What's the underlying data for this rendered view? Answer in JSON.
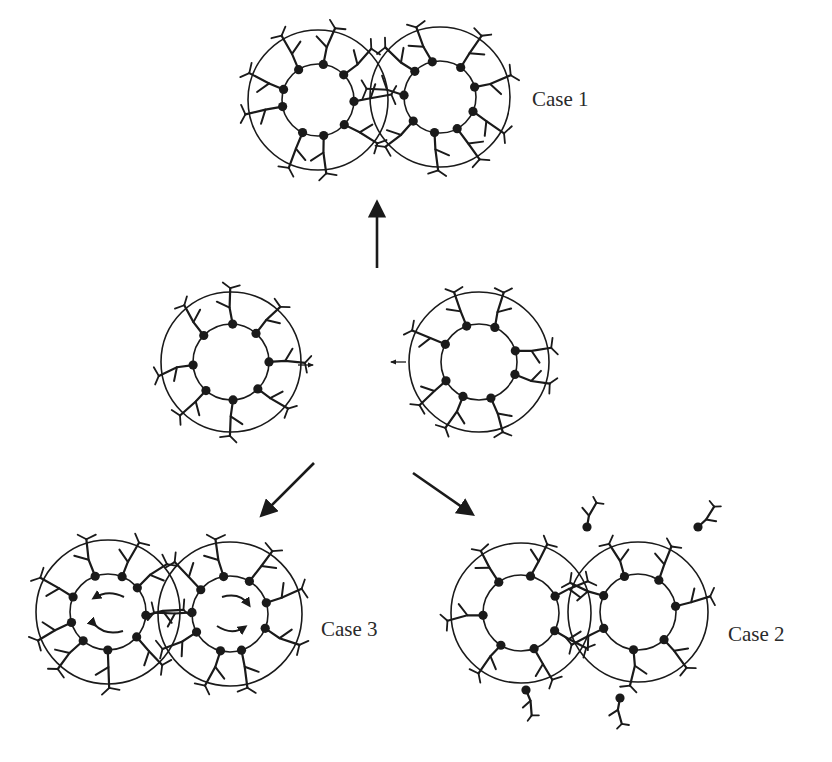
{
  "diagram": {
    "type": "schematic",
    "ink_color": "#1a1a1a",
    "background": "#ffffff",
    "labels": {
      "case1": "Case 1",
      "case2": "Case 2",
      "case3": "Case 3"
    },
    "nodes": [
      {
        "id": "initial-left",
        "cx": 231,
        "cy": 362,
        "r_outer": 70,
        "r_inner": 38,
        "ligands": 8
      },
      {
        "id": "initial-right",
        "cx": 479,
        "cy": 362,
        "r_outer": 70,
        "r_inner": 38,
        "ligands": 8
      },
      {
        "id": "case1-left",
        "cx": 318,
        "cy": 100,
        "r_outer": 70,
        "r_inner": 36,
        "ligands": 9
      },
      {
        "id": "case1-right",
        "cx": 440,
        "cy": 97,
        "r_outer": 70,
        "r_inner": 36,
        "ligands": 9
      },
      {
        "id": "case3-left",
        "cx": 108,
        "cy": 612,
        "r_outer": 72,
        "r_inner": 38,
        "ligands": 9
      },
      {
        "id": "case3-right",
        "cx": 230,
        "cy": 614,
        "r_outer": 72,
        "r_inner": 38,
        "ligands": 9
      },
      {
        "id": "case2-left",
        "cx": 521,
        "cy": 613,
        "r_outer": 70,
        "r_inner": 38,
        "ligands": 7
      },
      {
        "id": "case2-right",
        "cx": 638,
        "cy": 612,
        "r_outer": 70,
        "r_inner": 38,
        "ligands": 7
      }
    ],
    "edges": [
      {
        "from": "initial",
        "to": "case1",
        "direction": "up"
      },
      {
        "from": "initial",
        "to": "case3",
        "direction": "down-left"
      },
      {
        "from": "initial",
        "to": "case2",
        "direction": "down-right"
      }
    ],
    "annotations": {
      "approach_arrows": [
        "right-pointing arrow beside left particle",
        "left-pointing arrow beside right particle"
      ],
      "case3_rotation": "curved arrows inside cores indicating rotation (left counter-clockwise, right clockwise)",
      "case2_free_ligands": 4
    }
  }
}
